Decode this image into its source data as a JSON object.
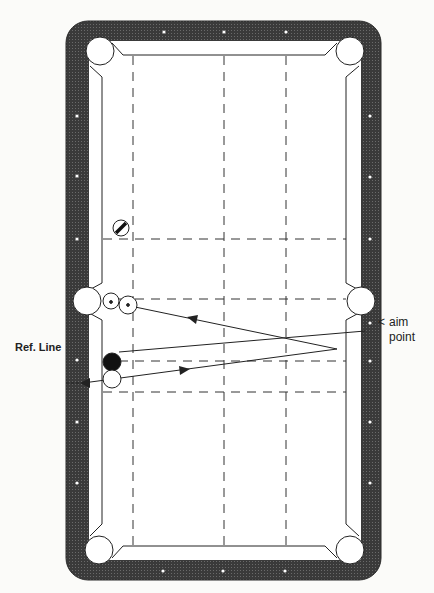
{
  "labels": {
    "ref_line": "Ref. Line",
    "aim_marker": "<",
    "aim_point_line1": "aim",
    "aim_point_line2": "point"
  },
  "colors": {
    "background": "#fbfbf9",
    "rail": "#3a3a3a",
    "cloth": "#ffffff",
    "line": "#222222",
    "diamond": "#ffffff",
    "object_ball": "#111111"
  },
  "table": {
    "outer": {
      "x": 66,
      "y": 21,
      "w": 315,
      "h": 559,
      "r": 22
    },
    "inner": {
      "x": 89,
      "y": 41,
      "w": 272,
      "h": 519
    },
    "pockets": [
      {
        "name": "top-left",
        "cx": 100,
        "cy": 51,
        "r": 14
      },
      {
        "name": "top-right",
        "cx": 350,
        "cy": 51,
        "r": 14
      },
      {
        "name": "side-left",
        "cx": 87,
        "cy": 301,
        "r": 14
      },
      {
        "name": "side-right",
        "cx": 361,
        "cy": 301,
        "r": 14
      },
      {
        "name": "bottom-left",
        "cx": 99,
        "cy": 550,
        "r": 14
      },
      {
        "name": "bottom-right",
        "cx": 350,
        "cy": 550,
        "r": 14
      }
    ],
    "diamonds": {
      "top": [
        [
          164,
          32
        ],
        [
          224,
          32
        ],
        [
          286,
          32
        ]
      ],
      "bottom": [
        [
          163,
          571
        ],
        [
          223,
          571
        ],
        [
          285,
          571
        ]
      ],
      "left": [
        [
          77,
          116
        ],
        [
          77,
          176
        ],
        [
          77,
          239
        ],
        [
          77,
          360
        ],
        [
          77,
          422
        ],
        [
          77,
          483
        ]
      ],
      "right": [
        [
          370,
          116
        ],
        [
          370,
          177
        ],
        [
          370,
          239
        ],
        [
          370,
          323
        ],
        [
          370,
          361
        ],
        [
          370,
          422
        ],
        [
          370,
          483
        ]
      ]
    }
  },
  "grid": {
    "vertical_x": [
      133,
      224,
      286
    ],
    "vertical_y_range": [
      56,
      545
    ],
    "horizontal_y": [
      239,
      299,
      361,
      392
    ],
    "horizontal_x_range": [
      103,
      346
    ]
  },
  "balls": [
    {
      "name": "striped-ball",
      "cx": 121,
      "cy": 228,
      "r": 8,
      "type": "stripe"
    },
    {
      "name": "object-ball-1",
      "cx": 111,
      "cy": 301,
      "r": 8,
      "type": "outline",
      "dot": true
    },
    {
      "name": "object-ball-2",
      "cx": 128,
      "cy": 305,
      "r": 9,
      "type": "outline",
      "dot": true
    },
    {
      "name": "black-ball",
      "cx": 112,
      "cy": 362,
      "r": 9,
      "type": "solid"
    },
    {
      "name": "cue-ball",
      "cx": 112,
      "cy": 379,
      "r": 9,
      "type": "outline"
    }
  ],
  "paths": {
    "shot_out": {
      "from": [
        83,
        383
      ],
      "to": [
        337,
        349
      ],
      "arrow_at": [
        185,
        370
      ],
      "arrow_dir": "right"
    },
    "shot_back": {
      "from": [
        337,
        349
      ],
      "to": [
        111,
        302
      ],
      "arrow_at": [
        193,
        318
      ],
      "arrow_dir": "left"
    },
    "ref_line": {
      "from": [
        119,
        352
      ],
      "to": [
        365,
        331
      ]
    },
    "ref_marker": {
      "from": [
        66,
        383
      ],
      "to": [
        80,
        383
      ]
    }
  }
}
